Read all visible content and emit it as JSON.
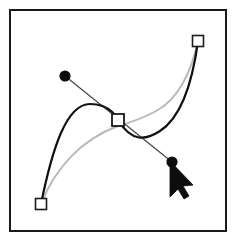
{
  "illustration": {
    "title": "Bezier curve handle adjustment",
    "description": "Vector path editing canvas showing a bold edited bezier curve, a faint gray original curve, three square anchor points, two round direction handle points connected by a tangent line, and an arrow mouse cursor dragging the lower handle.",
    "canvas": {
      "width": 236,
      "height": 241,
      "background_color": "#ffffff"
    }
  },
  "frame": {
    "name": "canvas-border",
    "x": 10,
    "y": 10,
    "width": 216,
    "height": 221,
    "stroke_color": "#1a1a1a",
    "stroke_width": 2,
    "fill_color": "#ffffff"
  },
  "curves": {
    "edited": {
      "label": "Edited bezier curve",
      "stroke_color": "#111111",
      "stroke_width": 2.2,
      "path": "M 41,204 C 52,150 66,104 90,104 C 112,104 118,120 118,120 C 132,143 146,140 160,131 C 180,118 192,86 198,41",
      "peak_point": {
        "x": 85,
        "y": 104
      },
      "dip_point": {
        "x": 152,
        "y": 137
      }
    },
    "original": {
      "label": "Original bezier curve (ghost)",
      "stroke_color": "#b9b9b9",
      "stroke_width": 2.0,
      "path": "M 41,204 C 55,168 82,139 118,126 C 118,126 140,120 158,110 C 177,99 191,74 198,41"
    }
  },
  "handle_line": {
    "label": "Tangent direction handle line",
    "stroke_color": "#4a4a4a",
    "stroke_width": 1.3,
    "from": {
      "x": 65,
      "y": 76
    },
    "to": {
      "x": 172,
      "y": 162
    }
  },
  "anchors": [
    {
      "name": "anchor-point-start",
      "label": "Start anchor",
      "shape": "square",
      "x": 41,
      "y": 204,
      "size": 11,
      "fill_color": "#ffffff",
      "stroke_color": "#1a1a1a",
      "stroke_width": 1.6
    },
    {
      "name": "anchor-point-middle",
      "label": "Selected middle anchor",
      "shape": "square",
      "x": 118,
      "y": 120,
      "size": 12,
      "fill_color": "#ffffff",
      "stroke_color": "#1a1a1a",
      "stroke_width": 1.8
    },
    {
      "name": "anchor-point-end",
      "label": "End anchor",
      "shape": "square",
      "x": 198,
      "y": 41,
      "size": 11,
      "fill_color": "#ffffff",
      "stroke_color": "#1a1a1a",
      "stroke_width": 1.6
    }
  ],
  "control_points": [
    {
      "name": "control-point-in",
      "label": "Incoming direction handle",
      "shape": "circle",
      "x": 65,
      "y": 76,
      "radius": 5.6,
      "fill_color": "#0d0d0d"
    },
    {
      "name": "control-point-out",
      "label": "Outgoing direction handle (dragged)",
      "shape": "circle",
      "x": 172,
      "y": 162,
      "radius": 5.6,
      "fill_color": "#0d0d0d"
    }
  ],
  "cursor": {
    "name": "arrow-cursor",
    "label": "Mouse arrow pointer",
    "tip": {
      "x": 170,
      "y": 161
    },
    "fill_color": "#0d0d0d",
    "stroke_color": "#0d0d0d",
    "path": "M 170,161 L 170,197 L 178,189 L 184,199 L 189,196 L 183,186 L 193,185 Z"
  }
}
